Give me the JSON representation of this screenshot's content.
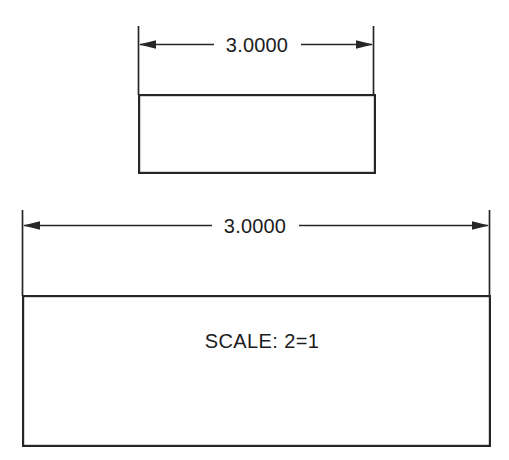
{
  "drawing": {
    "title": "Mechanical Part Dimension Drawing",
    "background_color": "#ffffff",
    "line_color": "#262626",
    "text_color": "#1c1c1c"
  },
  "upper_view": {
    "name": "upper-part-view",
    "dimension": {
      "label": "3.0000",
      "value": 3.0,
      "units": "inches",
      "orientation": "horizontal",
      "placement": "above"
    }
  },
  "lower_view": {
    "name": "lower-part-view",
    "dimension": {
      "label": "3.0000",
      "value": 3.0,
      "units": "inches",
      "orientation": "horizontal",
      "placement": "above"
    },
    "note": {
      "label": "SCALE:  2=1",
      "ratio_numerator": 2,
      "ratio_denominator": 1
    }
  }
}
